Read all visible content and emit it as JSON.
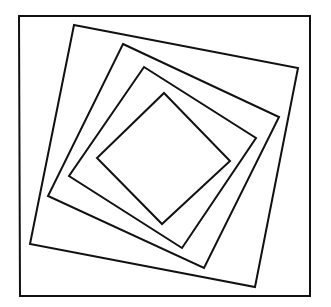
{
  "diagram": {
    "stroke_color": "#111111",
    "background": "#ffffff",
    "shapes": [
      {
        "name": "outer-square",
        "points": [
          [
            19,
            16
          ],
          [
            310,
            16
          ],
          [
            310,
            296
          ],
          [
            20,
            296
          ]
        ]
      },
      {
        "name": "rotated-square-1",
        "points": [
          [
            74,
            25
          ],
          [
            298,
            68
          ],
          [
            255,
            287
          ],
          [
            30,
            244
          ]
        ]
      },
      {
        "name": "rotated-square-2",
        "points": [
          [
            123,
            44
          ],
          [
            279,
            117
          ],
          [
            204,
            268
          ],
          [
            48,
            196
          ]
        ]
      },
      {
        "name": "rotated-square-3",
        "points": [
          [
            144,
            67
          ],
          [
            256,
            138
          ],
          [
            182,
            248
          ],
          [
            69,
            176
          ]
        ]
      },
      {
        "name": "rotated-square-4",
        "points": [
          [
            164,
            93
          ],
          [
            230,
            161
          ],
          [
            162,
            224
          ],
          [
            97,
            158
          ]
        ]
      }
    ]
  }
}
